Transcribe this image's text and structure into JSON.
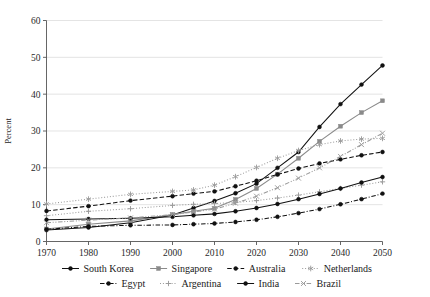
{
  "chart_data": {
    "type": "line",
    "title": "",
    "xlabel": "",
    "ylabel": "Percent",
    "xlim": [
      1970,
      2050
    ],
    "ylim": [
      0,
      60
    ],
    "yticks": [
      0,
      10,
      20,
      30,
      40,
      50,
      60
    ],
    "xticks": [
      1970,
      1980,
      1990,
      2000,
      2010,
      2020,
      2030,
      2040,
      2050
    ],
    "grid": true,
    "legend_position": "bottom",
    "x": [
      1970,
      1980,
      1990,
      2000,
      2005,
      2010,
      2015,
      2020,
      2025,
      2030,
      2035,
      2040,
      2045,
      2050
    ],
    "series": [
      {
        "name": "South Korea",
        "marker": "filled-circle",
        "linestyle": "solid",
        "color": "#111111",
        "values": [
          3.1,
          3.8,
          5.1,
          7.2,
          9.1,
          11.0,
          13.1,
          15.7,
          20.0,
          24.3,
          31.1,
          37.3,
          42.6,
          47.8
        ]
      },
      {
        "name": "Singapore",
        "marker": "filled-square",
        "linestyle": "solid",
        "color": "#8a8a8a",
        "values": [
          3.4,
          4.7,
          5.6,
          7.3,
          8.2,
          9.0,
          11.4,
          14.4,
          18.3,
          22.6,
          27.2,
          31.3,
          35.0,
          38.2
        ]
      },
      {
        "name": "Australia",
        "marker": "filled-circle",
        "linestyle": "dashed",
        "color": "#111111",
        "values": [
          8.3,
          9.6,
          11.1,
          12.3,
          13.0,
          13.6,
          15.0,
          16.5,
          18.2,
          19.8,
          21.2,
          22.3,
          23.4,
          24.3
        ]
      },
      {
        "name": "Netherlands",
        "marker": "star",
        "linestyle": "dotted",
        "color": "#9a9a9a",
        "values": [
          10.2,
          11.5,
          12.8,
          13.6,
          14.0,
          15.3,
          17.6,
          20.1,
          22.6,
          24.7,
          26.3,
          27.3,
          27.8,
          28.0
        ]
      },
      {
        "name": "Egypt",
        "marker": "filled-circle",
        "linestyle": "dash-dot",
        "color": "#111111",
        "values": [
          3.3,
          4.1,
          4.4,
          4.5,
          4.7,
          4.9,
          5.3,
          5.9,
          6.7,
          7.7,
          8.8,
          10.1,
          11.5,
          13.0
        ]
      },
      {
        "name": "Argentina",
        "marker": "plus",
        "linestyle": "dotted",
        "color": "#9a9a9a",
        "values": [
          7.0,
          8.2,
          8.9,
          9.8,
          10.1,
          10.3,
          10.6,
          11.1,
          11.8,
          12.6,
          13.5,
          14.4,
          15.3,
          16.2
        ]
      },
      {
        "name": "India",
        "marker": "filled-circle",
        "linestyle": "solid",
        "color": "#111111",
        "values": [
          5.9,
          6.1,
          6.3,
          6.7,
          7.1,
          7.5,
          8.2,
          9.1,
          10.2,
          11.5,
          12.9,
          14.4,
          16.0,
          17.5
        ]
      },
      {
        "name": "Brazil",
        "marker": "cross",
        "linestyle": "dash-dot-dot",
        "color": "#9a9a9a",
        "values": [
          5.1,
          5.8,
          6.4,
          7.3,
          8.0,
          8.8,
          10.4,
          12.3,
          14.6,
          17.2,
          20.0,
          23.1,
          26.3,
          29.4
        ]
      }
    ],
    "legend_rows": [
      [
        "South Korea",
        "Singapore",
        "Australia",
        "Netherlands"
      ],
      [
        "Egypt",
        "Argentina",
        "India",
        "Brazil"
      ]
    ]
  }
}
